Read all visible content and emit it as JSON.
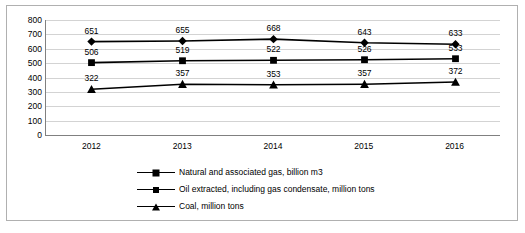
{
  "chart_data": {
    "type": "line",
    "title": "",
    "xlabel": "",
    "ylabel": "",
    "categories": [
      "2012",
      "2013",
      "2014",
      "2015",
      "2016"
    ],
    "ylim": [
      0,
      800
    ],
    "yticks": [
      "0",
      "100",
      "200",
      "300",
      "400",
      "500",
      "600",
      "700",
      "800"
    ],
    "grid": true,
    "legend_position": "bottom",
    "series": [
      {
        "name": "Natural and associated gas, billion m3",
        "marker": "diamond",
        "values": [
          651,
          655,
          668,
          643,
          633
        ],
        "labels": [
          "651",
          "655",
          "668",
          "643",
          "633"
        ]
      },
      {
        "name": "Oil extracted, including gas condensate, million tons",
        "marker": "square",
        "values": [
          506,
          519,
          522,
          526,
          533
        ],
        "labels": [
          "506",
          "519",
          "522",
          "526",
          "533"
        ]
      },
      {
        "name": "Coal, million tons",
        "marker": "triangle",
        "values": [
          322,
          357,
          353,
          357,
          372
        ],
        "labels": [
          "322",
          "357",
          "353",
          "357",
          "372"
        ]
      }
    ],
    "colors": {
      "series_line": "#000000",
      "grid": "#d3d3d3",
      "axis": "#808080",
      "frame": "#b0b0b0",
      "background": "#ffffff"
    }
  }
}
